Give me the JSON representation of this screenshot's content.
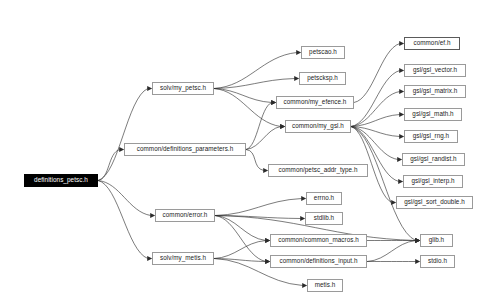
{
  "diagram": {
    "type": "directed-graph",
    "background_color": "#ffffff",
    "node_fill": "#ffffff",
    "node_border": "#9a9a9a",
    "root_fill": "#000000",
    "root_text": "#ffffff",
    "edge_color": "#2b2b2b"
  },
  "nodes": [
    {
      "id": "root",
      "label": "definitions_petsc.h",
      "x": 24,
      "y": 174,
      "w": 74,
      "style": "root"
    },
    {
      "id": "my_petsc",
      "label": "solv/my_petsc.h",
      "x": 152,
      "y": 82,
      "w": 62,
      "style": "normal"
    },
    {
      "id": "defs_par",
      "label": "common/definitions_parameters.h",
      "x": 124,
      "y": 143,
      "w": 122,
      "style": "normal"
    },
    {
      "id": "error",
      "label": "common/error.h",
      "x": 155,
      "y": 209,
      "w": 60,
      "style": "normal"
    },
    {
      "id": "my_metis",
      "label": "solv/my_metis.h",
      "x": 152,
      "y": 252,
      "w": 62,
      "style": "normal"
    },
    {
      "id": "petscao",
      "label": "petscao.h",
      "x": 301,
      "y": 46,
      "w": 44,
      "style": "normal"
    },
    {
      "id": "petscksp",
      "label": "petscksp.h",
      "x": 299,
      "y": 72,
      "w": 47,
      "style": "normal"
    },
    {
      "id": "my_efence",
      "label": "common/my_efence.h",
      "x": 276,
      "y": 96,
      "w": 78,
      "style": "normal"
    },
    {
      "id": "my_gsl",
      "label": "common/my_gsl.h",
      "x": 285,
      "y": 120,
      "w": 66,
      "style": "normal"
    },
    {
      "id": "addr_type",
      "label": "common/petsc_addr_type.h",
      "x": 268,
      "y": 164,
      "w": 100,
      "style": "normal"
    },
    {
      "id": "errno",
      "label": "errno.h",
      "x": 306,
      "y": 192,
      "w": 36,
      "style": "normal"
    },
    {
      "id": "stdlib",
      "label": "stdlib.h",
      "x": 305,
      "y": 212,
      "w": 38,
      "style": "normal"
    },
    {
      "id": "macros",
      "label": "common/common_macros.h",
      "x": 270,
      "y": 234,
      "w": 97,
      "style": "normal"
    },
    {
      "id": "defs_input",
      "label": "common/definitions_input.h",
      "x": 270,
      "y": 255,
      "w": 97,
      "style": "normal"
    },
    {
      "id": "metis",
      "label": "metis.h",
      "x": 307,
      "y": 279,
      "w": 36,
      "style": "normal"
    },
    {
      "id": "ef",
      "label": "common/ef.h",
      "x": 404,
      "y": 37,
      "w": 56,
      "style": "strong"
    },
    {
      "id": "gsl_vector",
      "label": "gsl/gsl_vector.h",
      "x": 404,
      "y": 64,
      "w": 62,
      "style": "normal"
    },
    {
      "id": "gsl_matrix",
      "label": "gsl/gsl_matrix.h",
      "x": 404,
      "y": 85,
      "w": 62,
      "style": "normal"
    },
    {
      "id": "gsl_math",
      "label": "gsl/gsl_math.h",
      "x": 404,
      "y": 108,
      "w": 58,
      "style": "normal"
    },
    {
      "id": "gsl_rng",
      "label": "gsl/gsl_rng.h",
      "x": 404,
      "y": 130,
      "w": 54,
      "style": "normal"
    },
    {
      "id": "gsl_randist",
      "label": "gsl/gsl_randist.h",
      "x": 402,
      "y": 153,
      "w": 63,
      "style": "normal"
    },
    {
      "id": "gsl_interp",
      "label": "gsl/gsl_interp.h",
      "x": 403,
      "y": 175,
      "w": 60,
      "style": "normal"
    },
    {
      "id": "gsl_sort",
      "label": "gsl/gsl_sort_double.h",
      "x": 396,
      "y": 196,
      "w": 77,
      "style": "normal"
    },
    {
      "id": "glib",
      "label": "glib.h",
      "x": 420,
      "y": 234,
      "w": 33,
      "style": "normal"
    },
    {
      "id": "stdio",
      "label": "stdio.h",
      "x": 420,
      "y": 255,
      "w": 35,
      "style": "normal"
    }
  ],
  "edges": [
    {
      "from": "root",
      "to": "my_petsc"
    },
    {
      "from": "root",
      "to": "defs_par"
    },
    {
      "from": "root",
      "to": "error"
    },
    {
      "from": "root",
      "to": "my_metis"
    },
    {
      "from": "my_petsc",
      "to": "petscao"
    },
    {
      "from": "my_petsc",
      "to": "petscksp"
    },
    {
      "from": "my_petsc",
      "to": "my_efence"
    },
    {
      "from": "my_petsc",
      "to": "my_gsl"
    },
    {
      "from": "defs_par",
      "to": "my_efence"
    },
    {
      "from": "defs_par",
      "to": "my_gsl"
    },
    {
      "from": "defs_par",
      "to": "addr_type"
    },
    {
      "from": "my_efence",
      "to": "ef"
    },
    {
      "from": "my_gsl",
      "to": "gsl_vector"
    },
    {
      "from": "my_gsl",
      "to": "gsl_matrix"
    },
    {
      "from": "my_gsl",
      "to": "gsl_math"
    },
    {
      "from": "my_gsl",
      "to": "gsl_rng"
    },
    {
      "from": "my_gsl",
      "to": "gsl_randist"
    },
    {
      "from": "my_gsl",
      "to": "gsl_interp"
    },
    {
      "from": "my_gsl",
      "to": "gsl_sort"
    },
    {
      "from": "my_gsl",
      "to": "glib"
    },
    {
      "from": "error",
      "to": "errno"
    },
    {
      "from": "error",
      "to": "stdlib"
    },
    {
      "from": "error",
      "to": "macros"
    },
    {
      "from": "error",
      "to": "defs_input"
    },
    {
      "from": "error",
      "to": "glib"
    },
    {
      "from": "my_metis",
      "to": "macros"
    },
    {
      "from": "my_metis",
      "to": "defs_input"
    },
    {
      "from": "my_metis",
      "to": "metis"
    },
    {
      "from": "macros",
      "to": "glib"
    },
    {
      "from": "defs_input",
      "to": "glib"
    },
    {
      "from": "defs_input",
      "to": "stdio"
    }
  ]
}
